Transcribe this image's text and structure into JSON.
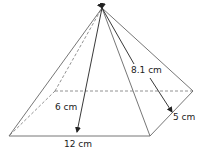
{
  "figure": {
    "type": "square-based pyramid (rectangular base)",
    "labels": {
      "slant_height": "8.1 cm",
      "height": "6 cm",
      "base_length": "12 cm",
      "base_width": "5 cm"
    },
    "colors": {
      "stroke": "#555555",
      "arrow": "#222222",
      "text": "#222222"
    }
  }
}
